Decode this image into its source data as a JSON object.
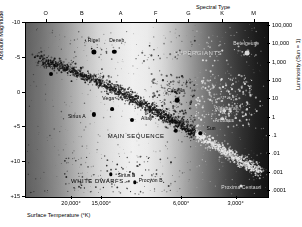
{
  "figure": {
    "kind": "hertzsprung-russell-diagram",
    "top_axis_title": "Spectral Type",
    "left_axis_title": "Absolute Magnitude",
    "right_axis_title": "Luminosity (Sun = 1)",
    "bottom_axis_title": "Surface Temperature (°K)"
  },
  "chart_data": {
    "type": "scatter",
    "title": "",
    "xlabel": "Surface Temperature (°K)",
    "ylabel": "Absolute Magnitude",
    "x2label": "Spectral Type",
    "y2label": "Luminosity (Sun = 1)",
    "grid": false,
    "legend": "none",
    "ylim": [
      -10,
      15
    ],
    "y2lim": [
      100000,
      0.0001
    ],
    "xticks": [
      {
        "label": "20,000°",
        "xpct": 19.0
      },
      {
        "label": "15,000°",
        "xpct": 31.5
      },
      {
        "label": "6,000°",
        "xpct": 64.5
      },
      {
        "label": "3,000°",
        "xpct": 87.0
      }
    ],
    "x2ticks": [
      {
        "label": "O",
        "xpct": 8.5
      },
      {
        "label": "B",
        "xpct": 23.5
      },
      {
        "label": "A",
        "xpct": 39.5
      },
      {
        "label": "F",
        "xpct": 54.0
      },
      {
        "label": "G",
        "xpct": 67.5
      },
      {
        "label": "K",
        "xpct": 81.5
      },
      {
        "label": "M",
        "xpct": 94.5
      }
    ],
    "yticks": [
      "-10",
      "-5",
      "0",
      "+5",
      "+10",
      "+15"
    ],
    "y2ticks": [
      "100,000",
      "10,000",
      "1,000",
      "100",
      "10",
      "1",
      ".1",
      ".01",
      ".001",
      ".0001"
    ],
    "regions": [
      {
        "label": "SUPERGIANTS",
        "xpct": 71.0,
        "ypct": 17.0,
        "tone": "light"
      },
      {
        "label": "MAIN SEQUENCE",
        "xpct": 45.5,
        "ypct": 65.0,
        "tone": "dark"
      },
      {
        "label": "WHITE DWARFS",
        "xpct": 29.5,
        "ypct": 91.0,
        "tone": "dark"
      }
    ],
    "points": [
      {
        "name": "Rigel",
        "xpct": 28.0,
        "ypct": 16.5,
        "r": 2.6,
        "lx": 28.0,
        "ly": 10.0,
        "tone": "dark"
      },
      {
        "name": "Deneb",
        "xpct": 36.5,
        "ypct": 16.5,
        "r": 2.2,
        "lx": 37.5,
        "ly": 10.0,
        "tone": "dark"
      },
      {
        "name": "Spica",
        "xpct": 10.5,
        "ypct": 29.5,
        "r": 2.0,
        "lx": 9.5,
        "ly": 24.0,
        "tone": "dark"
      },
      {
        "name": "Betelgeuse",
        "xpct": 91.5,
        "ypct": 17.5,
        "r": 2.4,
        "lx": 91.0,
        "ly": 11.5,
        "tone": "light"
      },
      {
        "name": "Capella",
        "xpct": 62.5,
        "ypct": 44.5,
        "r": 2.3,
        "lx": 62.0,
        "ly": 38.5,
        "tone": "dark"
      },
      {
        "name": "Vega",
        "xpct": 35.5,
        "ypct": 49.5,
        "r": 1.9,
        "lx": 34.0,
        "ly": 43.0,
        "tone": "dark"
      },
      {
        "name": "Sirius A",
        "xpct": 28.0,
        "ypct": 52.5,
        "r": 2.1,
        "lx": 21.0,
        "ly": 53.5,
        "tone": "dark"
      },
      {
        "name": "Altair",
        "xpct": 44.0,
        "ypct": 55.5,
        "r": 2.0,
        "lx": 50.0,
        "ly": 54.5,
        "tone": "dark"
      },
      {
        "name": "Procyon A",
        "xpct": 62.0,
        "ypct": 62.0,
        "r": 2.2,
        "lx": 62.5,
        "ly": 56.5,
        "tone": "dark"
      },
      {
        "name": "Sun",
        "xpct": 72.0,
        "ypct": 63.5,
        "r": 1.7,
        "lx": 76.5,
        "ly": 60.5,
        "tone": "dark"
      },
      {
        "name": "Aldebaran",
        "xpct": 82.0,
        "ypct": 50.5,
        "r": 1.8,
        "lx": 83.0,
        "ly": 49.0,
        "tone": "light"
      },
      {
        "name": "Arcturus",
        "xpct": 81.0,
        "ypct": 55.0,
        "r": 1.8,
        "lx": 82.0,
        "ly": 55.5,
        "tone": "light"
      },
      {
        "name": "Sirius B",
        "xpct": 35.0,
        "ypct": 87.0,
        "r": 1.7,
        "lx": 41.5,
        "ly": 87.5,
        "tone": "dark"
      },
      {
        "name": "Procyon B",
        "xpct": 45.0,
        "ypct": 91.5,
        "r": 1.7,
        "lx": 51.5,
        "ly": 90.0,
        "tone": "dark"
      },
      {
        "name": "Proxima Centauri",
        "xpct": 89.0,
        "ypct": 93.5,
        "r": 1.5,
        "lx": 89.0,
        "ly": 94.5,
        "tone": "light"
      }
    ]
  }
}
